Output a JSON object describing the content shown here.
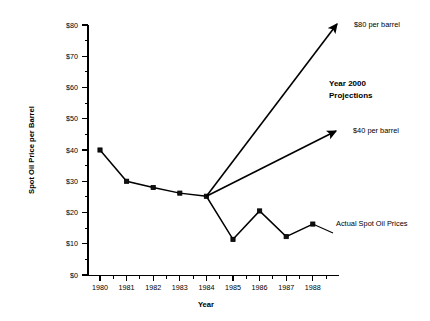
{
  "chart_data": {
    "type": "line",
    "title": "",
    "xlabel": "Year",
    "ylabel": "Spot Oil Price per Barrel",
    "categories": [
      "1980",
      "1981",
      "1982",
      "1983",
      "1984",
      "1985",
      "1986",
      "1987",
      "1988"
    ],
    "x": [
      1980,
      1981,
      1982,
      1983,
      1984,
      1985,
      1986,
      1987,
      1988
    ],
    "series": [
      {
        "name": "Actual Spot Oil Prices",
        "values": [
          40.0,
          30.0,
          28.0,
          26.2,
          25.2,
          11.4,
          20.5,
          12.3,
          16.3
        ]
      }
    ],
    "projections": [
      {
        "name": "$80 per barrel",
        "label": "$80 per barrel",
        "from_year": 1984,
        "from_value": 25.2,
        "to_value": 80,
        "arrow": true
      },
      {
        "name": "$40 per barrel",
        "label": "$40 per barrel",
        "from_year": 1984,
        "from_value": 25.2,
        "to_value": 44,
        "arrow": true
      }
    ],
    "annotations": [
      {
        "name": "projection-80-label",
        "text": "$80 per barrel"
      },
      {
        "name": "projection-group-label-line1",
        "text": "Year 2000"
      },
      {
        "name": "projection-group-label-line2",
        "text": "Projections"
      },
      {
        "name": "projection-40-label",
        "text": "$40 per barrel"
      },
      {
        "name": "actual-series-label",
        "text": "Actual Spot Oil Prices"
      }
    ],
    "ylim": [
      0,
      80
    ],
    "y_major_ticks": [
      "$0",
      "$10",
      "$20",
      "$30",
      "$40",
      "$50",
      "$60",
      "$70",
      "$80"
    ],
    "y_major_values": [
      0,
      10,
      20,
      30,
      40,
      50,
      60,
      70,
      80
    ],
    "y_minor_values": [
      5,
      15,
      25,
      35,
      45,
      55,
      65,
      75
    ],
    "xlim": [
      1979.5,
      1988.9
    ],
    "grid": false,
    "legend": "none",
    "marker": "square",
    "colors": {
      "line": "#000000",
      "marker": "#111111",
      "axis": "#000000",
      "background": "#ffffff",
      "text": "#000000"
    }
  },
  "axes": {
    "y_title": "Spot Oil Price per Barrel",
    "x_title": "Year"
  },
  "y_ticks": [
    {
      "label": "$80",
      "value": 80
    },
    {
      "label": "$70",
      "value": 70
    },
    {
      "label": "$60",
      "value": 60
    },
    {
      "label": "$50",
      "value": 50
    },
    {
      "label": "$40",
      "value": 40
    },
    {
      "label": "$30",
      "value": 30
    },
    {
      "label": "$20",
      "value": 20
    },
    {
      "label": "$10",
      "value": 10
    },
    {
      "label": "$0",
      "value": 0
    }
  ],
  "x_ticks": [
    {
      "label": "1980"
    },
    {
      "label": "1981"
    },
    {
      "label": "1982"
    },
    {
      "label": "1983"
    },
    {
      "label": "1984"
    },
    {
      "label": "1985"
    },
    {
      "label": "1986"
    },
    {
      "label": "1987"
    },
    {
      "label": "1988"
    }
  ],
  "annotations": {
    "projection_80": "$80 per barrel",
    "projection_group_1": "Year 2000",
    "projection_group_2": "Projections",
    "projection_40": "$40 per barrel",
    "actual_series": "Actual Spot Oil Prices"
  }
}
